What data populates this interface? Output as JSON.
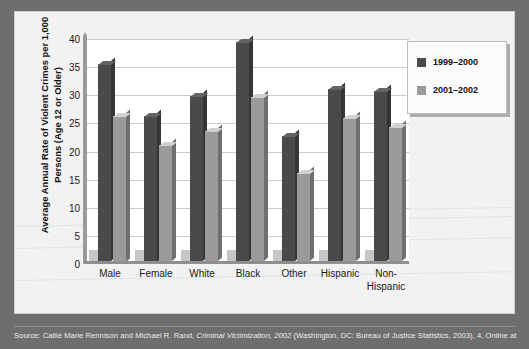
{
  "chart_data": {
    "type": "bar",
    "title": "",
    "xlabel": "",
    "ylabel": "Average Annual Rate of Violent Crimes per 1,000\nPersons (Age 12 or Older)",
    "categories": [
      "Male",
      "Female",
      "White",
      "Black",
      "Other",
      "Hispanic",
      "Non-\nHispanic"
    ],
    "series": [
      {
        "name": "1999–2000",
        "color": "#4a4a4a",
        "values": [
          35.5,
          26.4,
          29.8,
          39.4,
          22.8,
          31.2,
          30.7
        ]
      },
      {
        "name": "2001–2002",
        "color": "#9a9a9a",
        "values": [
          26.4,
          21.2,
          23.7,
          29.7,
          16.2,
          25.9,
          24.4
        ]
      }
    ],
    "ylim": [
      0,
      40
    ],
    "yticks": [
      "0",
      "5",
      "10",
      "15",
      "20",
      "25",
      "30",
      "35",
      "40"
    ],
    "ytick_step": 5,
    "grid": true,
    "legend_position": "top-right"
  },
  "legend": {
    "items": [
      {
        "label": "1999–2000",
        "color": "#4a4a4a"
      },
      {
        "label": "2001–2002",
        "color": "#9a9a9a"
      }
    ]
  },
  "source": {
    "prefix": "Source: Callie Marie Rennison and Michael R. Rand, ",
    "italic": "Criminal Victimization, 2002",
    "suffix": " (Washington, DC: Bureau of Justice Statistics, 2003), 4, Online at"
  },
  "colors": {
    "page_background": "#6e6e6e",
    "figure_background": "#f2f2f2",
    "plot_background": "#ffffff",
    "series_1999_2000": "#4a4a4a",
    "series_2001_2002": "#9a9a9a",
    "gridline": "#cccccc",
    "axis": "#8f8f8f"
  }
}
